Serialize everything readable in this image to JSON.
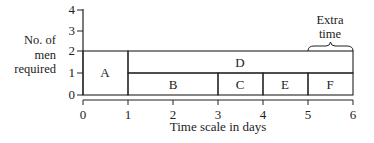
{
  "diagram": {
    "ylabel": [
      "No. of",
      "men",
      "required"
    ],
    "xlabel": "Time scale in days",
    "y_ticks": [
      "0",
      "1",
      "2",
      "3",
      "4"
    ],
    "x_ticks": [
      "0",
      "1",
      "2",
      "3",
      "4",
      "5",
      "6"
    ],
    "annotation": [
      "Extra",
      "time"
    ],
    "tasks": [
      {
        "label": "A",
        "start": 0,
        "end": 1,
        "men_from": 0,
        "men_to": 2
      },
      {
        "label": "B",
        "start": 1,
        "end": 3,
        "men_from": 0,
        "men_to": 1
      },
      {
        "label": "C",
        "start": 3,
        "end": 4,
        "men_from": 0,
        "men_to": 1
      },
      {
        "label": "E",
        "start": 4,
        "end": 5,
        "men_from": 0,
        "men_to": 1
      },
      {
        "label": "F",
        "start": 5,
        "end": 6,
        "men_from": 0,
        "men_to": 1
      },
      {
        "label": "D",
        "start": 1,
        "end": 6,
        "men_from": 1,
        "men_to": 2
      }
    ]
  }
}
